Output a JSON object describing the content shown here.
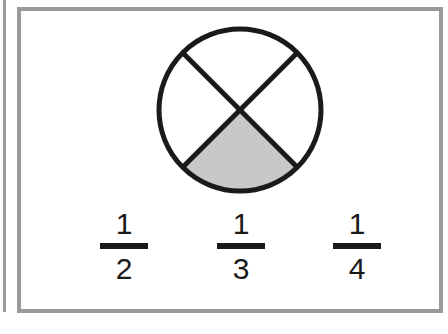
{
  "diagram": {
    "circle": {
      "parts": 4,
      "shaded_parts": 1,
      "shaded_region": "bottom",
      "shade_color": "#c8c8c8",
      "stroke_color": "#1a1a1a"
    },
    "fractions": [
      {
        "numerator": "1",
        "denominator": "2"
      },
      {
        "numerator": "1",
        "denominator": "3"
      },
      {
        "numerator": "1",
        "denominator": "4"
      }
    ]
  }
}
